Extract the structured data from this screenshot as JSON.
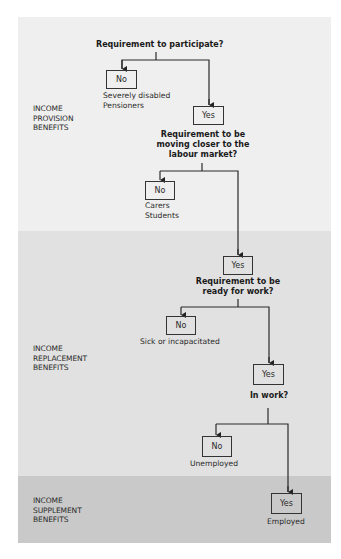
{
  "bands": [
    {
      "label_lines": [
        "INCOME",
        "PROVISION",
        "BENEFITS"
      ],
      "color": "#efefef"
    },
    {
      "label_lines": [
        "INCOME",
        "REPLACEMENT",
        "BENEFITS"
      ],
      "color": "#e1e1e1"
    },
    {
      "label_lines": [
        "INCOME",
        "SUPPLEMENT",
        "BENEFITS"
      ],
      "color": "#c9c9c9"
    }
  ],
  "questions": [
    {
      "lines": [
        "Requirement to participate?"
      ]
    },
    {
      "lines": [
        "Requirement to be",
        "moving closer to the",
        "labour market?"
      ]
    },
    {
      "lines": [
        "Requirement to be",
        "ready for work?"
      ]
    },
    {
      "lines": [
        "In work?"
      ]
    }
  ],
  "decisions": [
    {
      "no": {
        "label": "No",
        "outcome_lines": [
          "Severely disabled",
          "Pensioners"
        ]
      },
      "yes": {
        "label": "Yes"
      }
    },
    {
      "no": {
        "label": "No",
        "outcome_lines": [
          "Carers",
          "Students"
        ]
      },
      "yes": {
        "label": "Yes"
      }
    },
    {
      "no": {
        "label": "No",
        "outcome_lines": [
          "Sick or incapacitated"
        ]
      },
      "yes": {
        "label": "Yes"
      }
    },
    {
      "no": {
        "label": "No",
        "outcome_lines": [
          "Unemployed"
        ]
      },
      "yes": {
        "label": "Yes",
        "outcome_lines": [
          "Employed"
        ]
      }
    }
  ]
}
